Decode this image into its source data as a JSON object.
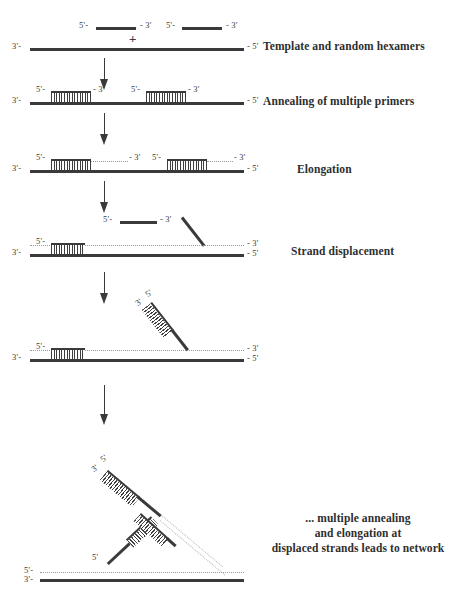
{
  "diagram": {
    "title": "Multiple displacement amplification",
    "colors": {
      "strand": "#3a3a3a",
      "dotted": "#9a9a9a",
      "text": "#2e2e2e",
      "background": "#ffffff"
    },
    "labels": {
      "five_prime_left": "5'-",
      "three_prime_right": "- 3'",
      "three_prime_left": "3'-",
      "five_prime_right": "- 5'",
      "five_prime_plain": "5'",
      "three_prime_plain": "3'",
      "plus": "+"
    },
    "stages": [
      {
        "id": "stage-1",
        "caption": "Template and random hexamers",
        "description": "Two free random hexamer primers above a long single-stranded template, joined by a plus sign.",
        "primers": 2,
        "template_labels": {
          "left": "3'-",
          "right": "- 5'"
        }
      },
      {
        "id": "stage-2",
        "caption": "Annealing of multiple primers",
        "description": "Two hexamers annealed as short hatched duplexes on the template.",
        "annealed_primers": 2
      },
      {
        "id": "stage-3",
        "caption": "Elongation",
        "description": "Annealed primers extended; dotted lines show newly synthesised DNA reaching the - 3' ends.",
        "annealed_primers": 2
      },
      {
        "id": "stage-4",
        "caption": "Strand displacement",
        "description": "A downstream strand is displaced by the polymerase; a free primer and a diagonal displaced strand appear above the template.",
        "annealed_primers": 1,
        "displaced_strands": 1
      },
      {
        "id": "stage-5",
        "caption": "",
        "description": "The displaced strand, now a primed hatched duplex, lifts away from the template.",
        "annealed_primers": 1,
        "displaced_strands": 1
      },
      {
        "id": "stage-6",
        "caption": "... multiple annealing\nand elongation at\ndisplaced strands leads to network",
        "caption_lines": [
          "... multiple annealing",
          "and elongation at",
          "displaced strands leads to network"
        ],
        "description": "Branched network: displaced strands are themselves primed and elongated, producing a hyper-branched structure above the template.",
        "branches": 3
      }
    ],
    "arrows": [
      {
        "id": "arrow-1",
        "from": "stage-1",
        "to": "stage-2"
      },
      {
        "id": "arrow-2",
        "from": "stage-2",
        "to": "stage-3"
      },
      {
        "id": "arrow-3",
        "from": "stage-3",
        "to": "stage-4"
      },
      {
        "id": "arrow-4",
        "from": "stage-4",
        "to": "stage-5"
      },
      {
        "id": "arrow-5",
        "from": "stage-5",
        "to": "stage-6"
      }
    ]
  }
}
